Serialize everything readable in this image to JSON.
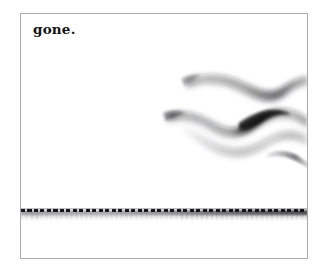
{
  "image": {
    "title": "gone.",
    "width": 324,
    "height": 276,
    "background_color": "#ffffff",
    "frame": {
      "border_color": "#a9a9ac",
      "fill_color": "#ffffff"
    }
  },
  "caption": {
    "text": "gone.",
    "color": "#141414",
    "position": "top-left"
  },
  "artwork": {
    "wave_field": {
      "name": "blurred-wave-bands",
      "description": "two soft sinuous smoke-like bands in the upper right",
      "ink_color": "#1a1a1e",
      "band_count": 2
    },
    "baseline": {
      "name": "dashed-horizon-line",
      "style": "dashed",
      "color": "#17171a",
      "shadow_color": "#3c3c3e",
      "description": "dashed horizontal rule with blurred shadow beneath"
    }
  }
}
